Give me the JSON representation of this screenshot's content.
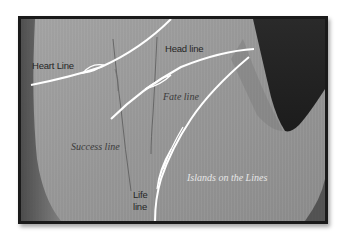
{
  "figure": {
    "colors": {
      "skin": "#8f8f8f",
      "skin_light": "#a3a3a3",
      "shadow": "#2e2e2e",
      "line_highlight": "#ffffff",
      "frame_border": "#1a1a1a"
    },
    "labels": {
      "heart_line": "Heart Line",
      "head_line": "Head line",
      "fate_line": "Fate line",
      "success_line": "Success line",
      "life_line_1": "Life",
      "life_line_2": "line",
      "islands": "Islands on the Lines"
    }
  }
}
